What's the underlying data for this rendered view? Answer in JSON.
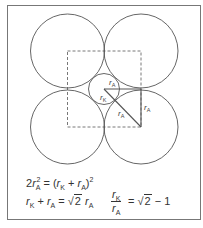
{
  "colors": {
    "stroke": "#555555",
    "frame": "#777777",
    "text": "#333333",
    "background": "#ffffff"
  },
  "diagram": {
    "type": "geometry",
    "large_circles": [
      {
        "cx": 67.5,
        "cy": 51,
        "r": 37
      },
      {
        "cx": 141,
        "cy": 51,
        "r": 37
      },
      {
        "cx": 67.5,
        "cy": 127,
        "r": 37
      },
      {
        "cx": 141,
        "cy": 127,
        "r": 37
      }
    ],
    "small_circle": {
      "cx": 104,
      "cy": 89,
      "r": 15.5
    },
    "dashed_square": {
      "x": 67.5,
      "y": 51,
      "w": 73.5,
      "h": 76
    },
    "labels": {
      "horizontal": {
        "base": "r",
        "sub": "A"
      },
      "small_radius": {
        "base": "r",
        "sub": "K"
      },
      "diagonal": {
        "base": "r",
        "sub": "A"
      },
      "vertical": {
        "base": "r",
        "sub": "A"
      }
    }
  },
  "equations": {
    "eq1": {
      "coef": "2",
      "r": "r",
      "sub_a": "A",
      "sup_2": "2",
      "equals": " = (",
      "rk": "r",
      "sub_k": "K",
      "plus": " + ",
      "ra": "r",
      "sub_a2": "A",
      "close": ")",
      "sup_2b": "2"
    },
    "eq2": {
      "rk": "r",
      "sub_k": "K",
      "plus": " + ",
      "ra": "r",
      "sub_a": "A",
      "equals": " = ",
      "sqrt_sym": "√",
      "sqrt_val": "2",
      "ra2": " r",
      "sub_a2": "A"
    },
    "eq3": {
      "num_r": "r",
      "num_sub": "K",
      "den_r": "r",
      "den_sub": "A",
      "equals": " = ",
      "sqrt_sym": "√",
      "sqrt_val": "2",
      "minus": " − 1"
    }
  }
}
